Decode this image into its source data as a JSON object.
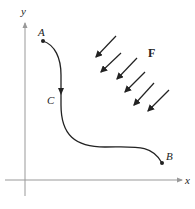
{
  "diagram": {
    "axes": {
      "x_label": "x",
      "y_label": "y",
      "color": "#999999"
    },
    "curve": {
      "color": "#222222",
      "points": {
        "start": "A",
        "middle": "C",
        "end": "B"
      }
    },
    "field": {
      "label": "F",
      "arrow_count": 6,
      "color": "#222222"
    }
  }
}
